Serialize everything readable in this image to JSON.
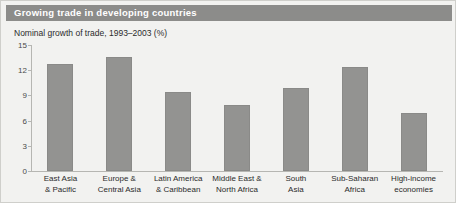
{
  "figure": {
    "title": "Growing trade in developing countries",
    "subtitle": "Nominal growth of trade, 1993–2003 (%)",
    "colors": {
      "title_bar": "#8c8c8a",
      "title_text": "#ffffff",
      "panel_background": "#f2f2f0",
      "bar_fill": "#939391",
      "axis": "#b6b6b2",
      "label_text": "#2b2b2b"
    }
  },
  "chart_data": {
    "type": "bar",
    "title": "Growing trade in developing countries",
    "subtitle": "Nominal growth of trade, 1993–2003 (%)",
    "xlabel": "",
    "ylabel": "",
    "ylim": [
      0,
      15
    ],
    "yticks": [
      0,
      3,
      6,
      9,
      12,
      15
    ],
    "grid": false,
    "legend": false,
    "categories": [
      "East Asia\n& Pacific",
      "Europe &\nCentral Asia",
      "Latin America\n& Caribbean",
      "Middle East &\nNorth Africa",
      "South\nAsia",
      "Sub-Saharan\nAfrica",
      "High-income\neconomies"
    ],
    "category_lines": [
      [
        "East Asia",
        "& Pacific"
      ],
      [
        "Europe &",
        "Central Asia"
      ],
      [
        "Latin America",
        "& Caribbean"
      ],
      [
        "Middle East &",
        "North Africa"
      ],
      [
        "South",
        "Asia"
      ],
      [
        "Sub-Saharan",
        "Africa"
      ],
      [
        "High-income",
        "economies"
      ]
    ],
    "values": [
      12.7,
      13.6,
      9.4,
      7.9,
      9.9,
      12.4,
      6.9
    ]
  }
}
